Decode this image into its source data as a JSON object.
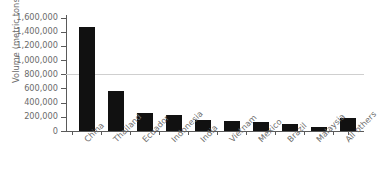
{
  "chart_data": {
    "type": "bar",
    "title": "",
    "xlabel": "",
    "ylabel": "Volume (metric tons)",
    "categories": [
      "China",
      "Thailand",
      "Ecuador",
      "Indonesia",
      "India",
      "Vietnam",
      "Mexico",
      "Brazil",
      "Malaysia",
      "All others"
    ],
    "values": [
      1460000,
      570000,
      255000,
      230000,
      155000,
      140000,
      125000,
      100000,
      58000,
      180000
    ],
    "ylim": [
      0,
      1600000
    ],
    "ytick_values": [
      0,
      200000,
      400000,
      600000,
      800000,
      1000000,
      1200000,
      1400000,
      1600000
    ],
    "ytick_labels": [
      "0",
      "200,000",
      "400,000",
      "600,000",
      "800,000",
      "1,000,000",
      "1,200,000",
      "1,400,000",
      "1,600,000"
    ],
    "grid": "single horizontal rule at 800,000",
    "gridline_values": [
      800000
    ],
    "legend": "none",
    "legend_position": "none",
    "bar_color": "#111111",
    "axis_color": "#5a5a5a",
    "grid_color": "#cfcfcf",
    "text_color": "#6b6b6b",
    "xtick_label_rotation": -45
  }
}
